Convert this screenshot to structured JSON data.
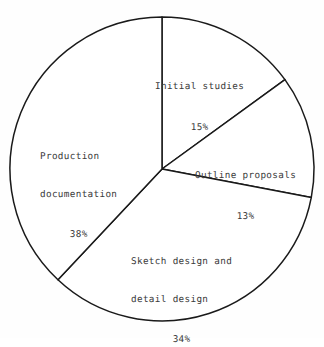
{
  "chart_data": {
    "type": "pie",
    "title": "",
    "subtitle": "",
    "xlabel": "",
    "ylabel": "",
    "legend": "none",
    "grid": false,
    "start_angle_deg": 0,
    "direction": "clockwise",
    "center": {
      "x": 162,
      "y": 169
    },
    "radius": 152,
    "unit": "%",
    "categories": [
      "Initial studies",
      "Outline proposals",
      "Sketch design and detail design",
      "Production documentation"
    ],
    "values": [
      15,
      13,
      34,
      38
    ],
    "slices": [
      {
        "label": "Initial studies",
        "label_lines": [
          "Initial studies"
        ],
        "value": 15,
        "percent_text": "15%",
        "angle_deg": 54.0,
        "start_deg": 0.0,
        "end_deg": 54.0,
        "fill": "#ffffff",
        "stroke": "#1a1a1a"
      },
      {
        "label": "Outline proposals",
        "label_lines": [
          "Outline proposals"
        ],
        "value": 13,
        "percent_text": "13%",
        "angle_deg": 46.8,
        "start_deg": 54.0,
        "end_deg": 100.8,
        "fill": "#ffffff",
        "stroke": "#1a1a1a"
      },
      {
        "label": "Sketch design and detail design",
        "label_lines": [
          "Sketch design and",
          "detail design"
        ],
        "value": 34,
        "percent_text": "34%",
        "angle_deg": 122.4,
        "start_deg": 100.8,
        "end_deg": 223.2,
        "fill": "#ffffff",
        "stroke": "#1a1a1a"
      },
      {
        "label": "Production documentation",
        "label_lines": [
          "Production",
          "documentation"
        ],
        "value": 38,
        "percent_text": "38%",
        "angle_deg": 136.8,
        "start_deg": 223.2,
        "end_deg": 360.0,
        "fill": "#ffffff",
        "stroke": "#1a1a1a"
      }
    ]
  },
  "labels": {
    "initial_studies": {
      "line1": "Initial studies",
      "percent": "15%"
    },
    "outline_proposals": {
      "line1": "Outline proposals",
      "percent": "13%"
    },
    "sketch_design": {
      "line1": "Sketch design and",
      "line2": "detail design",
      "percent": "34%"
    },
    "production_documentation": {
      "line1": "Production",
      "line2": "documentation",
      "percent": "38%"
    }
  },
  "colors": {
    "background": "#fefefe",
    "stroke": "#1a1a1a",
    "text": "#3a3a3a"
  }
}
